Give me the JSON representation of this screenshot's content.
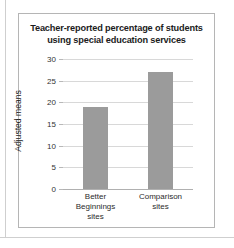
{
  "figure": {
    "title_lines": [
      "Teacher-reported percentage of students",
      "using special education services"
    ]
  },
  "chart_data": {
    "type": "bar",
    "title": "Teacher-reported percentage of students using special education services",
    "xlabel": "",
    "ylabel": "Adjusted means",
    "categories": [
      "Better Beginnings sites",
      "Comparison sites"
    ],
    "category_label_lines": [
      [
        "Better",
        "Beginnings",
        "sites"
      ],
      [
        "Comparison",
        "sites"
      ]
    ],
    "values": [
      19,
      27
    ],
    "ylim": [
      0,
      30
    ],
    "yticks": [
      0,
      5,
      10,
      15,
      20,
      25,
      30
    ],
    "ytick_labels": [
      "0",
      "5",
      "10",
      "15",
      "20",
      "25",
      "30"
    ],
    "grid": true,
    "legend": false,
    "bar_color": "#9b9b9b",
    "gridline_color": "#d8d8d8"
  }
}
